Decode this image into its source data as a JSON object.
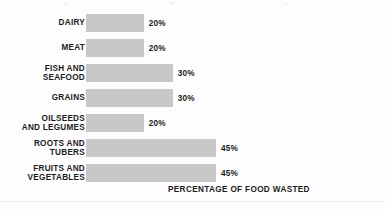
{
  "chart_data": {
    "type": "bar",
    "orientation": "horizontal",
    "title": "",
    "xlabel": "PERCENTAGE OF FOOD WASTED",
    "ylabel": "",
    "xlim": [
      0,
      45
    ],
    "grid": false,
    "legend": "none",
    "bar_color": "#c8c8c8",
    "text_color": "#1c1c1c",
    "background_color": "#fdfdfd",
    "categories": [
      "DAIRY",
      "MEAT",
      "FISH AND\nSEAFOOD",
      "GRAINS",
      "OILSEEDS\nAND LEGUMES",
      "ROOTS AND\nTUBERS",
      "FRUITS AND\nVEGETABLES"
    ],
    "values": [
      20,
      20,
      30,
      30,
      20,
      45,
      45
    ],
    "value_labels": [
      "20%",
      "20%",
      "30%",
      "30%",
      "20%",
      "45%",
      "45%"
    ]
  },
  "axis": {
    "caption": "PERCENTAGE OF FOOD WASTED"
  }
}
